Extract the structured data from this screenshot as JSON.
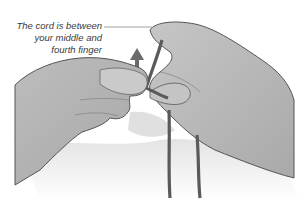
{
  "illustration": {
    "subject": "Two hands holding a cord between fingers",
    "caption": {
      "lines": [
        "The cord is between",
        "your middle and",
        "fourth finger"
      ]
    },
    "colors": {
      "background": "#ffffff",
      "skin": "#b4b4b4",
      "skin_light": "#cfcfcf",
      "outline": "#555555",
      "cord": "#5a5a5a",
      "arrow": "#6a6a6a",
      "shadow": "#e4e4e4",
      "caption_text": "#3a3a3a",
      "leader_line": "#8a8a8a"
    },
    "icons": [
      "up-arrow-icon"
    ]
  }
}
